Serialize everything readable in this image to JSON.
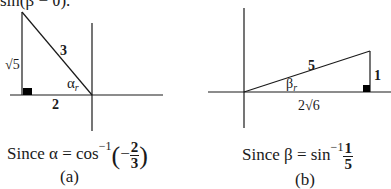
{
  "top_fragment": "sin(β − θ).",
  "panel_a": {
    "hypotenuse": "3",
    "vertical_side": "√5",
    "horizontal_side": "2",
    "angle_label": "α",
    "angle_sub": "r",
    "caption_prefix": "Since α  =  cos",
    "caption_exp": "−1",
    "caption_sign": "−",
    "caption_num": "2",
    "caption_den": "3",
    "label": "(a)"
  },
  "panel_b": {
    "hypotenuse": "5",
    "vertical_side": "1",
    "horizontal_side": "2√6",
    "angle_label": "β",
    "angle_sub": "r",
    "caption_prefix": "Since β  =  sin",
    "caption_exp": "−1",
    "caption_num": "1",
    "caption_den": "5",
    "label": "(b)"
  }
}
